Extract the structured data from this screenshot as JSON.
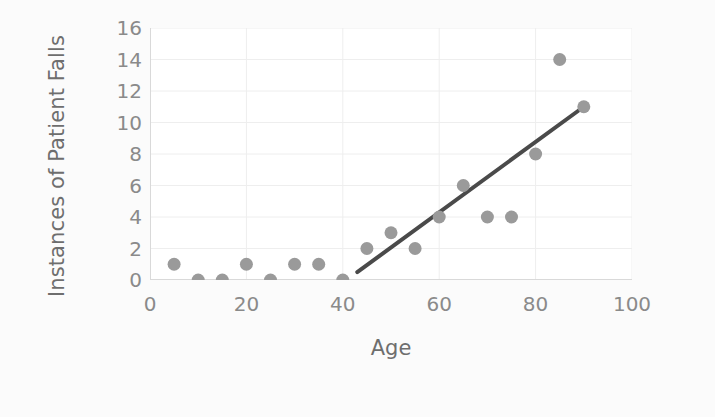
{
  "chart_data": {
    "type": "scatter",
    "title": "",
    "xlabel": "Age",
    "ylabel": "Instances of Patient Falls",
    "xlim": [
      0,
      100
    ],
    "ylim": [
      0,
      16
    ],
    "xticks": [
      0,
      20,
      40,
      60,
      80,
      100
    ],
    "yticks": [
      0,
      2,
      4,
      6,
      8,
      10,
      12,
      14,
      16
    ],
    "xtick_labels": [
      "0",
      "20",
      "40",
      "60",
      "80",
      "100"
    ],
    "ytick_labels": [
      "0",
      "2",
      "4",
      "6",
      "8",
      "10",
      "12",
      "14",
      "16"
    ],
    "grid": true,
    "grid_axis": "both",
    "legend": false,
    "legend_position": "none",
    "marker_color": "#9a9a9a",
    "marker_shape": "circle",
    "marker_size": 13,
    "trendline_color": "#4a4a4a",
    "grid_color": "#eeeeee",
    "axis_line_color": "#d9d9d9",
    "tick_label_color": "#8a8a8a",
    "axis_title_color": "#6e6e6e",
    "plot_background": "#ffffff",
    "figure_background": "#fbfbfb",
    "x": [
      5,
      10,
      15,
      20,
      25,
      30,
      35,
      40,
      45,
      50,
      55,
      60,
      65,
      70,
      75,
      80,
      85,
      90
    ],
    "y": [
      1,
      0,
      0,
      1,
      0,
      1,
      1,
      0,
      2,
      3,
      2,
      4,
      6,
      4,
      4,
      8,
      14,
      11
    ],
    "points": [
      {
        "x": 5,
        "y": 1
      },
      {
        "x": 10,
        "y": 0
      },
      {
        "x": 15,
        "y": 0
      },
      {
        "x": 20,
        "y": 1
      },
      {
        "x": 25,
        "y": 0
      },
      {
        "x": 30,
        "y": 1
      },
      {
        "x": 35,
        "y": 1
      },
      {
        "x": 40,
        "y": 0
      },
      {
        "x": 45,
        "y": 2
      },
      {
        "x": 50,
        "y": 3
      },
      {
        "x": 55,
        "y": 2
      },
      {
        "x": 60,
        "y": 4
      },
      {
        "x": 65,
        "y": 6
      },
      {
        "x": 70,
        "y": 4
      },
      {
        "x": 75,
        "y": 4
      },
      {
        "x": 80,
        "y": 8
      },
      {
        "x": 85,
        "y": 14
      },
      {
        "x": 90,
        "y": 11
      }
    ],
    "trendline": {
      "x_start": 43,
      "y_start": 0.5,
      "x_end": 90,
      "y_end": 11,
      "width": 4
    }
  }
}
